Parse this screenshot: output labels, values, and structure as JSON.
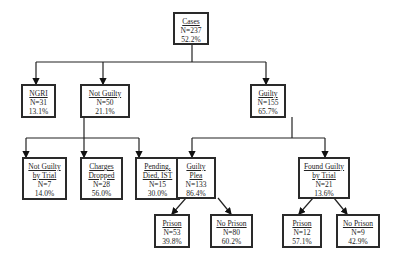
{
  "nodes": {
    "cases": {
      "title": "Cases",
      "n": "N=237",
      "pct": "52.2%"
    },
    "ngri": {
      "title": "NGRI",
      "n": "N=31",
      "pct": "13.1%"
    },
    "not_guilty": {
      "title": "Not Guilty",
      "n": "N=50",
      "pct": "21.1%"
    },
    "guilty": {
      "title": "Guilty",
      "n": "N=155",
      "pct": "65.7%"
    },
    "ng_trial": {
      "title1": "Not Guilty",
      "title2": "by Trial",
      "n": "N=7",
      "pct": "14.0%"
    },
    "charges_dropped": {
      "title1": "Charges",
      "title2": "Dropped",
      "n": "N=28",
      "pct": "56.0%"
    },
    "pending": {
      "title1": "Pending,",
      "title2": "Died, IST",
      "n": "N=15",
      "pct": "30.0%"
    },
    "guilty_plea": {
      "title1": "Guilty",
      "title2": "Plea",
      "n": "N=133",
      "pct": "86.4%"
    },
    "found_guilty": {
      "title1": "Found Guilty",
      "title2": "by Trial",
      "n": "N=21",
      "pct": "13.6%"
    },
    "plea_prison": {
      "title": "Prison",
      "n": "N=53",
      "pct": "39.8%"
    },
    "plea_no_prison": {
      "title": "No Prison",
      "n": "N=80",
      "pct": "60.2%"
    },
    "trial_prison": {
      "title": "Prison",
      "n": "N=12",
      "pct": "57.1%"
    },
    "trial_no_prison": {
      "title": "No Prison",
      "n": "N=9",
      "pct": "42.9%"
    }
  }
}
